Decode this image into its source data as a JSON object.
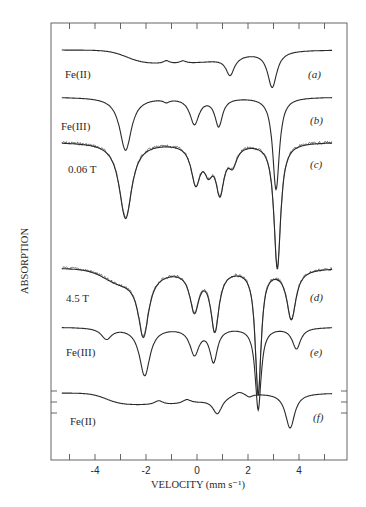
{
  "chart_data": {
    "type": "line",
    "title": "",
    "xlabel": "VELOCITY (mm s⁻¹)",
    "ylabel": "ABSORPTION",
    "xlim": [
      -5.7,
      5.9
    ],
    "x_ticks": [
      -4,
      -2,
      0,
      2,
      4
    ],
    "x_minor_ticks": [
      -5,
      -3,
      -1,
      1,
      3,
      5
    ],
    "grid": false,
    "legend": "none",
    "series": [
      {
        "panel": "(a)",
        "name": "Fe(II)",
        "kind": "fit",
        "baseline_px": 50,
        "v_range": [
          -5.3,
          5.3
        ],
        "components": [
          {
            "v": -2.75,
            "depth": 14,
            "width": 0.35,
            "shape": "step",
            "to": 1.3
          },
          {
            "v": -1.2,
            "depth": -3,
            "width": 0.15
          },
          {
            "v": -0.55,
            "depth": -2.5,
            "width": 0.15
          },
          {
            "v": 1.3,
            "depth": 18,
            "width": 0.2
          },
          {
            "v": 2.95,
            "depth": 36,
            "width": 0.22
          }
        ]
      },
      {
        "panel": "(b)",
        "name": "Fe(III)",
        "kind": "fit",
        "baseline_px": 97,
        "v_range": [
          -5.3,
          5.3
        ],
        "components": [
          {
            "v": -2.8,
            "depth": 53,
            "width": 0.28
          },
          {
            "v": -1.2,
            "depth": 3,
            "width": 0.15
          },
          {
            "v": -0.1,
            "depth": 26,
            "width": 0.22
          },
          {
            "v": 0.85,
            "depth": 28,
            "width": 0.18
          },
          {
            "v": 3.1,
            "depth": 92,
            "width": 0.16
          }
        ]
      },
      {
        "panel": "(c)",
        "name": "0.06 T",
        "kind": "data+fit",
        "baseline_px": 142,
        "v_range": [
          -5.3,
          5.3
        ],
        "components": [
          {
            "v": -2.8,
            "depth": 76,
            "width": 0.3
          },
          {
            "v": -0.05,
            "depth": 38,
            "width": 0.22
          },
          {
            "v": 0.9,
            "depth": 46,
            "width": 0.2
          },
          {
            "v": 0.45,
            "depth": 22,
            "width": 0.2
          },
          {
            "v": 1.4,
            "depth": 18,
            "width": 0.2
          },
          {
            "v": 3.15,
            "depth": 126,
            "width": 0.16
          }
        ]
      },
      {
        "panel": "(d)",
        "name": "4.5 T",
        "kind": "data+fit",
        "baseline_px": 268,
        "v_range": [
          -5.3,
          5.3
        ],
        "components": [
          {
            "v": -3.5,
            "depth": 24,
            "width": 0.35,
            "shape": "step",
            "to": -2.5
          },
          {
            "v": -2.1,
            "depth": 60,
            "width": 0.25
          },
          {
            "v": -0.1,
            "depth": 40,
            "width": 0.22
          },
          {
            "v": 0.7,
            "depth": 60,
            "width": 0.2
          },
          {
            "v": 2.4,
            "depth": 125,
            "width": 0.14
          },
          {
            "v": 3.7,
            "depth": 50,
            "width": 0.22
          }
        ]
      },
      {
        "panel": "(e)",
        "name": "Fe(III)",
        "kind": "fit",
        "baseline_px": 327,
        "v_range": [
          -5.3,
          5.3
        ],
        "components": [
          {
            "v": -3.55,
            "depth": 11,
            "width": 0.25
          },
          {
            "v": -2.05,
            "depth": 48,
            "width": 0.25
          },
          {
            "v": -0.1,
            "depth": 26,
            "width": 0.22
          },
          {
            "v": 0.65,
            "depth": 33,
            "width": 0.18
          },
          {
            "v": 2.4,
            "depth": 82,
            "width": 0.14
          },
          {
            "v": 3.9,
            "depth": 21,
            "width": 0.2
          }
        ]
      },
      {
        "panel": "(f)",
        "name": "Fe(II)",
        "kind": "fit",
        "baseline_px": 393,
        "v_range": [
          -5.3,
          5.3
        ],
        "components": [
          {
            "v": -3.55,
            "depth": 12,
            "width": 0.3,
            "shape": "step",
            "to": 0.6
          },
          {
            "v": -1.5,
            "depth": -4,
            "width": 0.2
          },
          {
            "v": -0.4,
            "depth": -4,
            "width": 0.2
          },
          {
            "v": 0.8,
            "depth": 16,
            "width": 0.22
          },
          {
            "v": 1.65,
            "depth": -4,
            "width": 0.25
          },
          {
            "v": 2.05,
            "depth": 3,
            "width": 0.15
          },
          {
            "v": 3.65,
            "depth": 35,
            "width": 0.22
          }
        ]
      }
    ],
    "annotations": [
      "Fe(II)",
      "Fe(III)",
      "0.06 T",
      "4.5 T",
      "Fe(III)",
      "Fe(II)"
    ],
    "panel_labels": [
      "(a)",
      "(b)",
      "(c)",
      "(d)",
      "(e)",
      "(f)"
    ]
  },
  "labels": {
    "a_name": "Fe(II)",
    "a_panel": "(a)",
    "b_name": "Fe(III)",
    "b_panel": "(b)",
    "c_name": "0.06 T",
    "c_panel": "(c)",
    "d_name": "4.5 T",
    "d_panel": "(d)",
    "e_name": "Fe(III)",
    "e_panel": "(e)",
    "f_name": "Fe(II)",
    "f_panel": "(f)",
    "xlabel": "VELOCITY (mm s⁻¹)",
    "ylabel": "ABSORPTION",
    "tick_m4": "-4",
    "tick_m2": "-2",
    "tick_0": "0",
    "tick_2": "2",
    "tick_4": "4"
  },
  "colors": {
    "line": "#2a2a2a",
    "frame": "#555555",
    "background": "#ffffff"
  }
}
